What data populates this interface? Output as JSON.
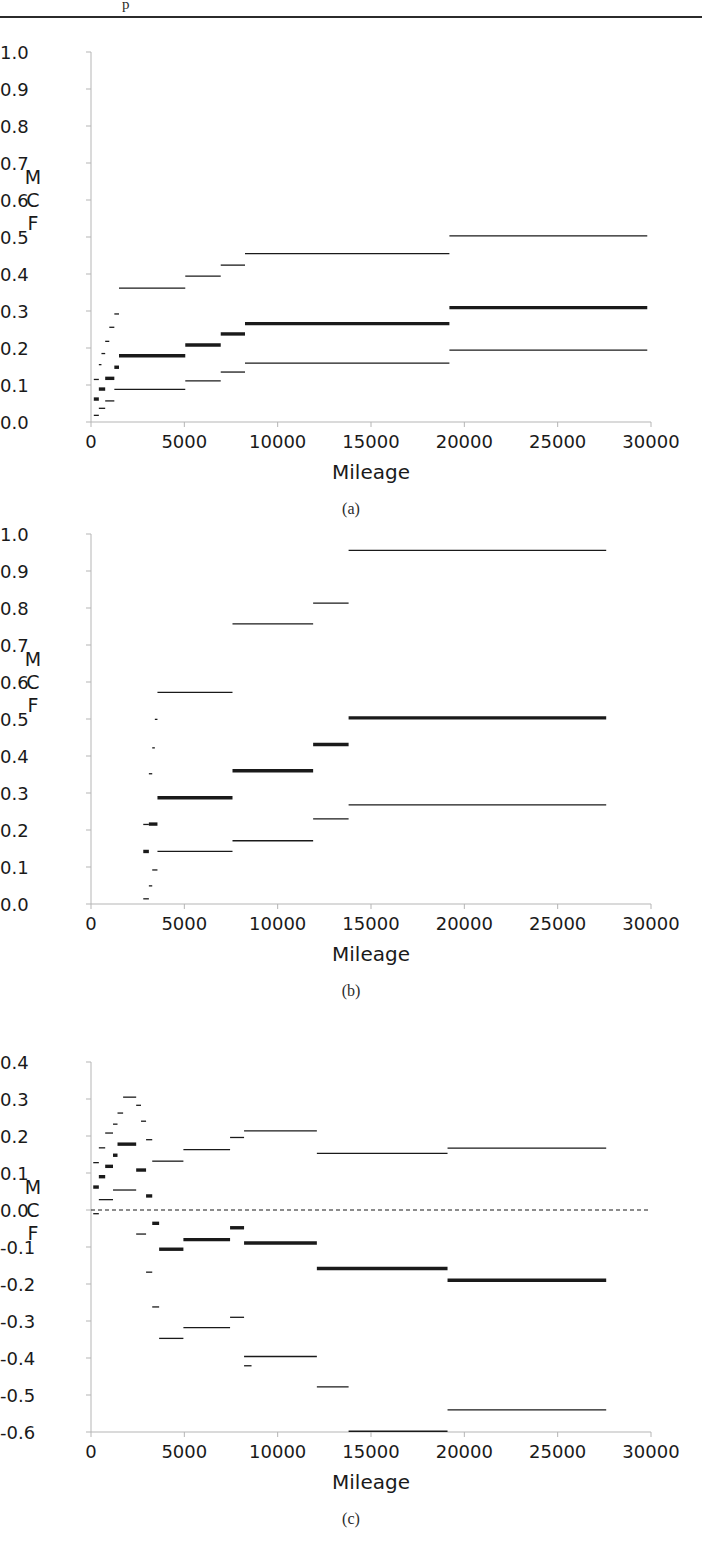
{
  "page": {
    "top_text_fragment": "p",
    "axis_title": "Mileage",
    "y_axis_label_letters": [
      "M",
      "C",
      "F"
    ]
  },
  "panels": [
    {
      "letter": "(a)"
    },
    {
      "letter": "(b)"
    },
    {
      "letter": "(c)"
    }
  ],
  "chart_data": [
    {
      "type": "line",
      "title": "",
      "subtitle": "(a)",
      "xlabel": "Mileage",
      "ylabel": "MCF",
      "xlim": [
        0,
        30000
      ],
      "ylim": [
        0.0,
        1.0
      ],
      "grid": false,
      "legend": "none",
      "xticks": [
        0,
        5000,
        10000,
        15000,
        20000,
        25000,
        30000
      ],
      "xticklabels": [
        "0",
        "5000",
        "10000",
        "15000",
        "20000",
        "25000",
        "30000"
      ],
      "yticks": [
        0.0,
        0.1,
        0.2,
        0.3,
        0.4,
        0.5,
        0.6,
        0.7,
        0.8,
        0.9,
        1.0
      ],
      "yticklabels": [
        "0.0",
        "0.1",
        "0.2",
        "0.3",
        "0.4",
        "0.5",
        "0.6",
        "0.7",
        "0.8",
        "0.9",
        "1.0"
      ],
      "series": [
        {
          "name": "upper-confidence-limit",
          "style": "thin",
          "steps": [
            {
              "x0": 150,
              "x1": 420,
              "y": 0.115
            },
            {
              "x0": 420,
              "x1": 560,
              "y": 0.155
            },
            {
              "x0": 560,
              "x1": 760,
              "y": 0.185
            },
            {
              "x0": 760,
              "x1": 980,
              "y": 0.218
            },
            {
              "x0": 980,
              "x1": 1250,
              "y": 0.256
            },
            {
              "x0": 1250,
              "x1": 1500,
              "y": 0.292
            },
            {
              "x0": 1500,
              "x1": 5050,
              "y": 0.362
            },
            {
              "x0": 5050,
              "x1": 6950,
              "y": 0.394
            },
            {
              "x0": 6950,
              "x1": 8250,
              "y": 0.424
            },
            {
              "x0": 8250,
              "x1": 19200,
              "y": 0.455
            },
            {
              "x0": 19200,
              "x1": 29800,
              "y": 0.503
            }
          ]
        },
        {
          "name": "mcf-estimate",
          "style": "thick",
          "steps": [
            {
              "x0": 150,
              "x1": 420,
              "y": 0.062
            },
            {
              "x0": 420,
              "x1": 760,
              "y": 0.089
            },
            {
              "x0": 760,
              "x1": 1250,
              "y": 0.118
            },
            {
              "x0": 1250,
              "x1": 1500,
              "y": 0.148
            },
            {
              "x0": 1500,
              "x1": 5050,
              "y": 0.179
            },
            {
              "x0": 5050,
              "x1": 6950,
              "y": 0.208
            },
            {
              "x0": 6950,
              "x1": 8250,
              "y": 0.238
            },
            {
              "x0": 8250,
              "x1": 19200,
              "y": 0.266
            },
            {
              "x0": 19200,
              "x1": 29800,
              "y": 0.309
            }
          ]
        },
        {
          "name": "lower-confidence-limit",
          "style": "thin",
          "steps": [
            {
              "x0": 150,
              "x1": 420,
              "y": 0.018
            },
            {
              "x0": 420,
              "x1": 760,
              "y": 0.037
            },
            {
              "x0": 760,
              "x1": 1250,
              "y": 0.057
            },
            {
              "x0": 1250,
              "x1": 5050,
              "y": 0.088
            },
            {
              "x0": 5050,
              "x1": 6950,
              "y": 0.111
            },
            {
              "x0": 6950,
              "x1": 8250,
              "y": 0.135
            },
            {
              "x0": 8250,
              "x1": 19200,
              "y": 0.159
            },
            {
              "x0": 19200,
              "x1": 29800,
              "y": 0.194
            }
          ]
        }
      ]
    },
    {
      "type": "line",
      "title": "",
      "subtitle": "(b)",
      "xlabel": "Mileage",
      "ylabel": "MCF",
      "xlim": [
        0,
        30000
      ],
      "ylim": [
        0.0,
        1.0
      ],
      "grid": false,
      "legend": "none",
      "xticks": [
        0,
        5000,
        10000,
        15000,
        20000,
        25000,
        30000
      ],
      "xticklabels": [
        "0",
        "5000",
        "10000",
        "15000",
        "20000",
        "25000",
        "30000"
      ],
      "yticks": [
        0.0,
        0.1,
        0.2,
        0.3,
        0.4,
        0.5,
        0.6,
        0.7,
        0.8,
        0.9,
        1.0
      ],
      "yticklabels": [
        "0.0",
        "0.1",
        "0.2",
        "0.3",
        "0.4",
        "0.5",
        "0.6",
        "0.7",
        "0.8",
        "0.9",
        "1.0"
      ],
      "series": [
        {
          "name": "upper-confidence-limit",
          "style": "thin",
          "steps": [
            {
              "x0": 2800,
              "x1": 3100,
              "y": 0.215
            },
            {
              "x0": 3100,
              "x1": 3280,
              "y": 0.352
            },
            {
              "x0": 3280,
              "x1": 3420,
              "y": 0.422
            },
            {
              "x0": 3420,
              "x1": 3560,
              "y": 0.499
            },
            {
              "x0": 3560,
              "x1": 7580,
              "y": 0.572
            },
            {
              "x0": 7580,
              "x1": 11900,
              "y": 0.757
            },
            {
              "x0": 11900,
              "x1": 13800,
              "y": 0.813
            },
            {
              "x0": 13800,
              "x1": 27600,
              "y": 0.956
            }
          ]
        },
        {
          "name": "mcf-estimate",
          "style": "thick",
          "steps": [
            {
              "x0": 2800,
              "x1": 3100,
              "y": 0.142
            },
            {
              "x0": 3100,
              "x1": 3560,
              "y": 0.216
            },
            {
              "x0": 3560,
              "x1": 7580,
              "y": 0.287
            },
            {
              "x0": 7580,
              "x1": 11900,
              "y": 0.36
            },
            {
              "x0": 11900,
              "x1": 13800,
              "y": 0.431
            },
            {
              "x0": 13800,
              "x1": 27600,
              "y": 0.503
            }
          ]
        },
        {
          "name": "lower-confidence-limit",
          "style": "thin",
          "steps": [
            {
              "x0": 2800,
              "x1": 3100,
              "y": 0.014
            },
            {
              "x0": 3100,
              "x1": 3280,
              "y": 0.049
            },
            {
              "x0": 3280,
              "x1": 3560,
              "y": 0.092
            },
            {
              "x0": 3560,
              "x1": 7580,
              "y": 0.142
            },
            {
              "x0": 7580,
              "x1": 11900,
              "y": 0.171
            },
            {
              "x0": 11900,
              "x1": 13800,
              "y": 0.23
            },
            {
              "x0": 13800,
              "x1": 27600,
              "y": 0.268
            }
          ]
        }
      ]
    },
    {
      "type": "line",
      "title": "",
      "subtitle": "(c)",
      "xlabel": "Mileage",
      "ylabel": "MCF",
      "xlim": [
        0,
        30000
      ],
      "ylim": [
        -0.6,
        0.4
      ],
      "grid": false,
      "legend": "none",
      "zero_reference_line": 0.0,
      "zero_line_style": "dashed",
      "xticks": [
        0,
        5000,
        10000,
        15000,
        20000,
        25000,
        30000
      ],
      "xticklabels": [
        "0",
        "5000",
        "10000",
        "15000",
        "20000",
        "25000",
        "30000"
      ],
      "yticks": [
        -0.6,
        -0.5,
        -0.4,
        -0.3,
        -0.2,
        -0.1,
        0.0,
        0.1,
        0.2,
        0.3,
        0.4
      ],
      "yticklabels": [
        "-0.6",
        "-0.5",
        "-0.4",
        "-0.3",
        "-0.2",
        "-0.1",
        "0.0",
        "0.1",
        "0.2",
        "0.3",
        "0.4"
      ],
      "series": [
        {
          "name": "upper-confidence-limit",
          "style": "thin",
          "steps": [
            {
              "x0": 120,
              "x1": 420,
              "y": 0.128
            },
            {
              "x0": 420,
              "x1": 760,
              "y": 0.168
            },
            {
              "x0": 760,
              "x1": 1180,
              "y": 0.208
            },
            {
              "x0": 1180,
              "x1": 1420,
              "y": 0.232
            },
            {
              "x0": 1420,
              "x1": 1720,
              "y": 0.262
            },
            {
              "x0": 1720,
              "x1": 2420,
              "y": 0.305
            },
            {
              "x0": 2420,
              "x1": 2680,
              "y": 0.283
            },
            {
              "x0": 2680,
              "x1": 2950,
              "y": 0.24
            },
            {
              "x0": 2950,
              "x1": 3280,
              "y": 0.19
            },
            {
              "x0": 3280,
              "x1": 4950,
              "y": 0.132
            },
            {
              "x0": 4950,
              "x1": 7450,
              "y": 0.163
            },
            {
              "x0": 7450,
              "x1": 8200,
              "y": 0.196
            },
            {
              "x0": 8200,
              "x1": 12100,
              "y": 0.214
            },
            {
              "x0": 12100,
              "x1": 19100,
              "y": 0.153
            },
            {
              "x0": 19100,
              "x1": 27600,
              "y": 0.167
            }
          ]
        },
        {
          "name": "mcf-difference-estimate",
          "style": "thick",
          "steps": [
            {
              "x0": 120,
              "x1": 420,
              "y": 0.062
            },
            {
              "x0": 420,
              "x1": 760,
              "y": 0.09
            },
            {
              "x0": 760,
              "x1": 1180,
              "y": 0.118
            },
            {
              "x0": 1180,
              "x1": 1420,
              "y": 0.148
            },
            {
              "x0": 1420,
              "x1": 2420,
              "y": 0.178
            },
            {
              "x0": 2420,
              "x1": 2950,
              "y": 0.108
            },
            {
              "x0": 2950,
              "x1": 3280,
              "y": 0.038
            },
            {
              "x0": 3280,
              "x1": 3650,
              "y": -0.036
            },
            {
              "x0": 3650,
              "x1": 4950,
              "y": -0.106
            },
            {
              "x0": 4950,
              "x1": 7450,
              "y": -0.08
            },
            {
              "x0": 7450,
              "x1": 8200,
              "y": -0.048
            },
            {
              "x0": 8200,
              "x1": 12100,
              "y": -0.089
            },
            {
              "x0": 12100,
              "x1": 19100,
              "y": -0.158
            },
            {
              "x0": 19100,
              "x1": 27600,
              "y": -0.19
            }
          ]
        },
        {
          "name": "lower-confidence-limit",
          "style": "thin",
          "steps": [
            {
              "x0": 120,
              "x1": 420,
              "y": -0.01
            },
            {
              "x0": 420,
              "x1": 1180,
              "y": 0.028
            },
            {
              "x0": 1180,
              "x1": 2420,
              "y": 0.054
            },
            {
              "x0": 2420,
              "x1": 2950,
              "y": -0.065
            },
            {
              "x0": 2950,
              "x1": 3280,
              "y": -0.168
            },
            {
              "x0": 3280,
              "x1": 3650,
              "y": -0.262
            },
            {
              "x0": 3650,
              "x1": 4950,
              "y": -0.347
            },
            {
              "x0": 4950,
              "x1": 7450,
              "y": -0.318
            },
            {
              "x0": 7450,
              "x1": 8200,
              "y": -0.29
            },
            {
              "x0": 8200,
              "x1": 12100,
              "y": -0.396
            },
            {
              "x0": 8200,
              "x1": 8600,
              "y": -0.421
            },
            {
              "x0": 12100,
              "x1": 13800,
              "y": -0.478
            },
            {
              "x0": 13800,
              "x1": 19100,
              "y": -0.598
            },
            {
              "x0": 19100,
              "x1": 27600,
              "y": -0.54
            }
          ]
        }
      ]
    }
  ]
}
